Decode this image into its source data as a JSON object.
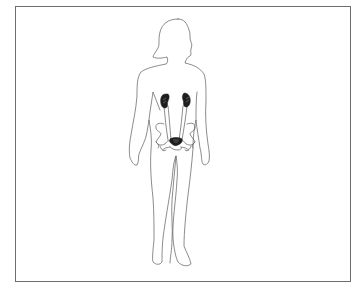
{
  "figure": {
    "view": "anterior",
    "highlighted_organs": [
      "left-kidney",
      "right-kidney",
      "bladder"
    ],
    "outlined_structures": [
      "ureters",
      "pelvis"
    ],
    "colors": {
      "outline": "#5a5a5a",
      "organ_fill": "#1e1e1e",
      "frame_border": "#6e6e6e",
      "background": "#ffffff"
    }
  }
}
